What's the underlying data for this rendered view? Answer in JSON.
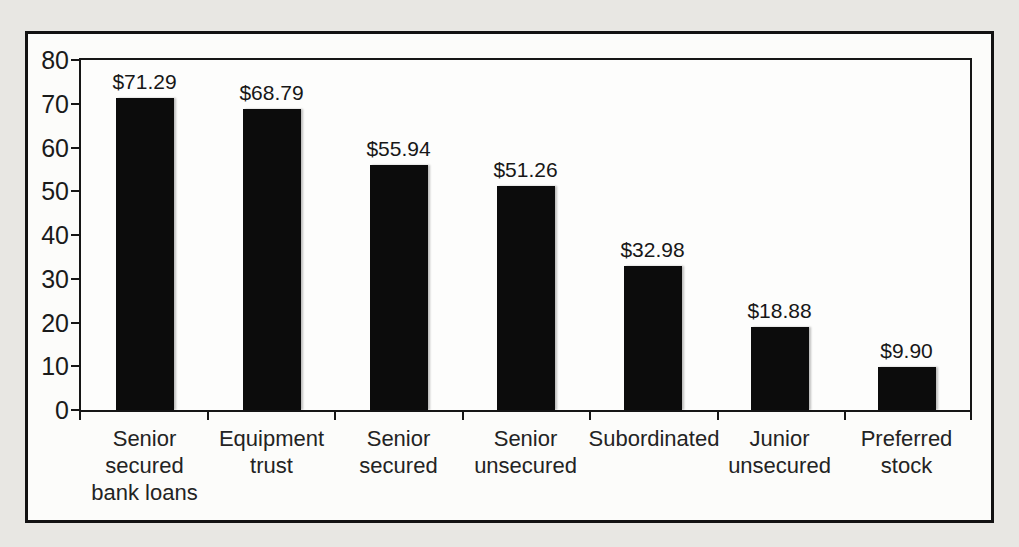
{
  "page": {
    "background_color": "#e8e7e3",
    "frame_background_color": "#fcfcfa",
    "frame_border_color": "#121212"
  },
  "chart_data": {
    "type": "bar",
    "title": "",
    "xlabel": "",
    "ylabel": "",
    "categories": [
      "Senior secured bank loans",
      "Equipment trust",
      "Senior secured",
      "Senior unsecured",
      "Subordinated",
      "Junior unsecured",
      "Preferred stock"
    ],
    "values": [
      71.29,
      68.79,
      55.94,
      51.26,
      32.98,
      18.88,
      9.9
    ],
    "value_labels": [
      "$71.29",
      "$68.79",
      "$55.94",
      "$51.26",
      "$32.98",
      "$18.88",
      "$9.90"
    ],
    "ylim": [
      0,
      80
    ],
    "ytick_interval": 10,
    "ytick_labels": [
      "0",
      "10",
      "20",
      "30",
      "40",
      "50",
      "60",
      "70",
      "80"
    ],
    "bar_color": "#0c0c0c",
    "grid": "off",
    "legend": "none"
  }
}
